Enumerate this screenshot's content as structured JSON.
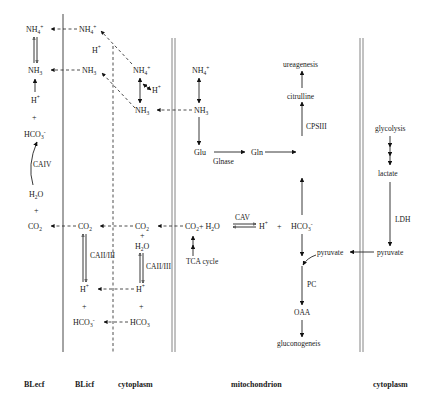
{
  "compartments": {
    "blecf": "BLecf",
    "blicf": "BLicf",
    "cytoplasm_left": "cytoplasm",
    "mitochondrion": "mitochondrion",
    "cytoplasm_right": "cytoplasm"
  },
  "blecf": {
    "nh4": "NH",
    "nh4_sub": "4",
    "nh4_sup": "+",
    "nh3": "NH",
    "nh3_sub": "3",
    "hplus": "H",
    "hplus_sup": "+",
    "plus1": "+",
    "hco3": "HCO",
    "hco3_sub": "3",
    "hco3_sup": "-",
    "caiv": "CAIV",
    "h2o": "H",
    "h2o_sub": "2",
    "h2o_tail": "O",
    "plus2": "+",
    "co2": "CO",
    "co2_sub": "2"
  },
  "blicf": {
    "nh4": "NH",
    "nh4_sub": "4",
    "nh4_sup": "+",
    "hplus_top": "H",
    "hplus_top_sup": "+",
    "nh3": "NH",
    "nh3_sub": "3",
    "co2": "CO",
    "co2_sub": "2",
    "ca": "CAII/III",
    "hplus": "H",
    "hplus_sup": "+",
    "plus": "+",
    "hco3": "HCO",
    "hco3_sub": "3",
    "hco3_sup": "-"
  },
  "cytoplasm_left": {
    "nh4": "NH",
    "nh4_sub": "4",
    "nh4_sup": "+",
    "hplus_side": "H",
    "hplus_side_sup": "+",
    "nh3": "NH",
    "nh3_sub": "3",
    "co2": "CO",
    "co2_sub": "2",
    "plus_top": "+",
    "h2o": "H",
    "h2o_sub": "2",
    "h2o_tail": "O",
    "ca": "CAII/III",
    "hplus": "H",
    "hplus_sup": "+",
    "plus": "+",
    "hco3": "HCO",
    "hco3_sub": "3"
  },
  "mitochondrion": {
    "nh4": "NH",
    "nh4_sub": "4",
    "nh4_sup": "+",
    "nh3": "NH",
    "nh3_sub": "3",
    "glu": "Glu",
    "glnase": "Glnase",
    "gln": "Gln",
    "ureagenesis": "ureagenesis",
    "citrulline": "citrulline",
    "cpsiii": "CPSIII",
    "co2": "CO",
    "co2_sub": "2",
    "plus_h2o": "+ H",
    "h2o_sub": "2",
    "h2o_tail": "O",
    "cav": "CAV",
    "hplus": "H",
    "hplus_sup": "+",
    "plus": "+",
    "hco3": "HCO",
    "hco3_sub": "3",
    "hco3_sup": "-",
    "tca": "TCA cycle",
    "pyruvate": "pyruvate",
    "pc": "PC",
    "oaa": "OAA",
    "gluconeogenesis": "gluconogeneis"
  },
  "cytoplasm_right": {
    "glycolysis": "glycolysis",
    "lactate": "lactate",
    "ldh": "LDH",
    "pyruvate": "pyruvate"
  }
}
